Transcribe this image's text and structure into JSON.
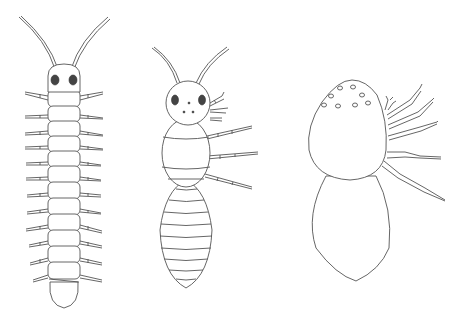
{
  "figure": {
    "background": "#ffffff",
    "line_color": "#555555",
    "eye_color": "#444444",
    "creatures": [
      {
        "name": "centipede",
        "body_segments": 12,
        "leg_pairs": 12,
        "has_antennae": true,
        "eyes": 2
      },
      {
        "name": "termite-like",
        "thorax_segments": 3,
        "abdomen_stripes": 9,
        "visible_legs": 3,
        "has_antennae": true,
        "eyes": 2,
        "head_dots": 3
      },
      {
        "name": "spider-like",
        "cephalothorax": true,
        "abdomen": true,
        "eye_dots": 8,
        "visible_legs": 5
      }
    ]
  }
}
